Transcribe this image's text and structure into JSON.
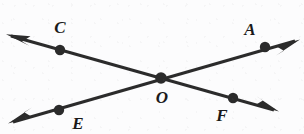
{
  "figure": {
    "type": "geometry-diagram",
    "canvas": {
      "width": 304,
      "height": 134
    },
    "background_color": "#fcfcfd",
    "stroke_color": "#2b2b2b",
    "label_color": "#1a1a1a",
    "line_width": 3,
    "dot_radius": 5.2,
    "intersection_dot_radius": 5.8,
    "points": [
      {
        "id": "C",
        "label": "C",
        "dot_x": 60,
        "dot_y": 50,
        "label_x": 60,
        "label_y": 27
      },
      {
        "id": "A",
        "label": "A",
        "dot_x": 265,
        "dot_y": 47,
        "label_x": 250,
        "label_y": 29
      },
      {
        "id": "O",
        "label": "O",
        "dot_x": 161,
        "dot_y": 78,
        "label_x": 162,
        "label_y": 97
      },
      {
        "id": "E",
        "label": "E",
        "dot_x": 59,
        "dot_y": 110,
        "label_x": 78,
        "label_y": 123
      },
      {
        "id": "F",
        "label": "F",
        "dot_x": 233,
        "dot_y": 98,
        "label_x": 222,
        "label_y": 115
      }
    ],
    "lines": [
      {
        "id": "line-CF",
        "through": [
          "C",
          "O",
          "F"
        ],
        "x1": 11,
        "y1": 36,
        "x2": 274,
        "y2": 110,
        "arrow_start": true,
        "arrow_end": true
      },
      {
        "id": "line-EA",
        "through": [
          "E",
          "O",
          "A"
        ],
        "x1": 13,
        "y1": 122,
        "x2": 295,
        "y2": 41,
        "arrow_start": true,
        "arrow_end": true
      }
    ]
  }
}
